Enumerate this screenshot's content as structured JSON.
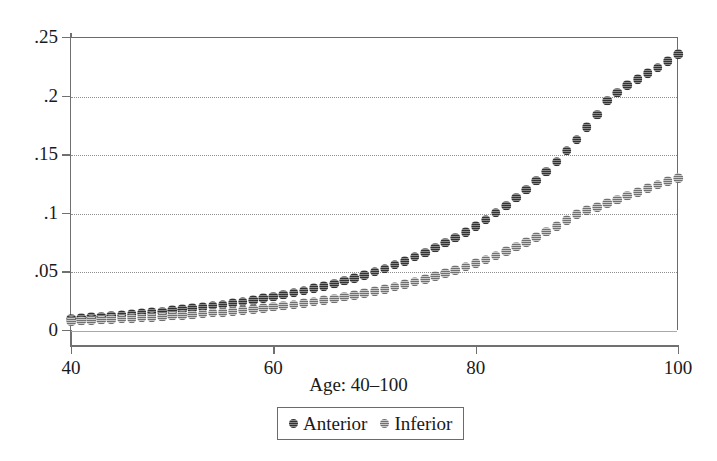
{
  "chart_data": {
    "type": "scatter",
    "title": "",
    "xlabel": "Age: 40–100",
    "ylabel": "",
    "xlim": [
      40,
      100
    ],
    "ylim": [
      0,
      0.25
    ],
    "xticks": [
      40,
      60,
      80,
      100
    ],
    "xtick_labels": [
      "40",
      "60",
      "80",
      "100"
    ],
    "yticks": [
      0,
      0.05,
      0.1,
      0.15,
      0.2,
      0.25
    ],
    "ytick_labels": [
      "0",
      ".05",
      ".1",
      ".15",
      ".2",
      ".25"
    ],
    "grid": true,
    "grid_axis": "y",
    "legend_position": "bottom-center",
    "x": [
      40,
      41,
      42,
      43,
      44,
      45,
      46,
      47,
      48,
      49,
      50,
      51,
      52,
      53,
      54,
      55,
      56,
      57,
      58,
      59,
      60,
      61,
      62,
      63,
      64,
      65,
      66,
      67,
      68,
      69,
      70,
      71,
      72,
      73,
      74,
      75,
      76,
      77,
      78,
      79,
      80,
      81,
      82,
      83,
      84,
      85,
      86,
      87,
      88,
      89,
      90,
      91,
      92,
      93,
      94,
      95,
      96,
      97,
      98,
      99,
      100
    ],
    "series": [
      {
        "name": "Anterior",
        "color": "#5a5a5a",
        "marker": "circle",
        "values": [
          0.0105,
          0.011,
          0.0116,
          0.0122,
          0.0128,
          0.0135,
          0.0142,
          0.015,
          0.0158,
          0.0166,
          0.0175,
          0.0184,
          0.0194,
          0.0204,
          0.0215,
          0.0226,
          0.0238,
          0.0251,
          0.0264,
          0.0278,
          0.0293,
          0.0309,
          0.0326,
          0.0344,
          0.0363,
          0.0383,
          0.0404,
          0.0427,
          0.0451,
          0.0477,
          0.0504,
          0.0533,
          0.0564,
          0.0597,
          0.0632,
          0.0669,
          0.0709,
          0.0751,
          0.0796,
          0.0844,
          0.0895,
          0.0949,
          0.1007,
          0.1069,
          0.1135,
          0.1205,
          0.128,
          0.136,
          0.1445,
          0.1536,
          0.1633,
          0.1737,
          0.1847,
          0.1965,
          0.2033,
          0.2095,
          0.215,
          0.2198,
          0.2248,
          0.23,
          0.236
        ]
      },
      {
        "name": "Inferior",
        "color": "#a0a0a0",
        "marker": "circle",
        "values": [
          0.0085,
          0.0088,
          0.0091,
          0.0095,
          0.0099,
          0.0103,
          0.0107,
          0.0112,
          0.0117,
          0.0122,
          0.0128,
          0.0134,
          0.014,
          0.0147,
          0.0154,
          0.0161,
          0.0169,
          0.0177,
          0.0186,
          0.0195,
          0.0205,
          0.0215,
          0.0226,
          0.0238,
          0.025,
          0.0263,
          0.0277,
          0.0291,
          0.0307,
          0.0323,
          0.034,
          0.0358,
          0.0377,
          0.0397,
          0.0419,
          0.0442,
          0.0466,
          0.0491,
          0.0518,
          0.0547,
          0.0577,
          0.0609,
          0.0643,
          0.0679,
          0.0717,
          0.0757,
          0.08,
          0.0845,
          0.0893,
          0.0944,
          0.0998,
          0.103,
          0.1058,
          0.1089,
          0.112,
          0.1152,
          0.1186,
          0.122,
          0.125,
          0.1278,
          0.1305
        ]
      }
    ],
    "legend": [
      {
        "label": "Anterior",
        "color": "#5a5a5a"
      },
      {
        "label": "Inferior",
        "color": "#a0a0a0"
      }
    ]
  }
}
